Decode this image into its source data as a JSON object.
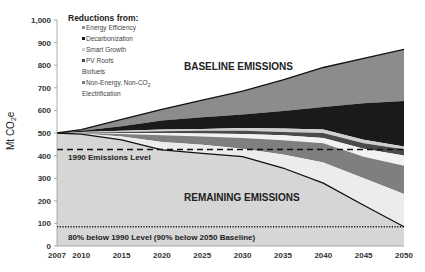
{
  "chart_data": {
    "type": "area",
    "title": "",
    "xlabel": "",
    "ylabel": "Mt CO2e",
    "ylim": [
      0,
      1000
    ],
    "xlim": [
      2007,
      2050
    ],
    "x": [
      2007,
      2010,
      2015,
      2020,
      2025,
      2030,
      2035,
      2040,
      2045,
      2050
    ],
    "x_tick_labels": [
      "2007",
      "2010",
      "2015",
      "2020",
      "2025",
      "2030",
      "2035",
      "2040",
      "2045",
      "2050"
    ],
    "y_ticks": [
      0,
      100,
      200,
      300,
      400,
      500,
      600,
      700,
      800,
      900,
      1000
    ],
    "y_tick_labels": [
      "0",
      "100",
      "200",
      "300",
      "400",
      "500",
      "600",
      "700",
      "800",
      "900",
      "1,000"
    ],
    "baseline_emissions": [
      500,
      515,
      560,
      605,
      645,
      685,
      735,
      790,
      830,
      870
    ],
    "remaining_emissions": [
      500,
      495,
      470,
      425,
      410,
      395,
      345,
      278,
      180,
      85
    ],
    "boundaries_top_down": {
      "energy_efficiency_bottom": [
        500,
        510,
        530,
        555,
        570,
        582,
        598,
        615,
        632,
        642
      ],
      "decarbonization_bottom": [
        500,
        505,
        510,
        515,
        518,
        522,
        520,
        515,
        470,
        440
      ],
      "smart_growth_bottom": [
        500,
        503,
        505,
        508,
        510,
        510,
        505,
        500,
        455,
        428
      ],
      "pv_roofs_bottom": [
        500,
        501,
        500,
        500,
        498,
        496,
        490,
        478,
        430,
        400
      ],
      "biofuels_bottom": [
        500,
        500,
        495,
        490,
        485,
        478,
        468,
        455,
        395,
        355
      ],
      "non_energy_bottom": [
        500,
        498,
        485,
        460,
        448,
        430,
        405,
        370,
        300,
        230
      ]
    },
    "series": [
      {
        "name": "Energy Efficiency",
        "color": "#8c8c8c"
      },
      {
        "name": "Decarbonization",
        "color": "#1a1a1a"
      },
      {
        "name": "Smart Growth",
        "color": "#cfcfcf"
      },
      {
        "name": "PV Roofs",
        "color": "#4a4a4a"
      },
      {
        "name": "Biofuels",
        "color": "#f2f2f2"
      },
      {
        "name": "Non-Energy, Non-CO2",
        "color": "#7f7f7f"
      },
      {
        "name": "Electrification",
        "color": "#ececec"
      },
      {
        "name": "Remaining Emissions",
        "color": "#d6d6d6"
      }
    ],
    "reference_lines": [
      {
        "name": "1990 Emissions Level",
        "value": 427,
        "style": "dashed"
      },
      {
        "name": "80% below 1990 Level (90% below 2050 Baseline)",
        "value": 85,
        "style": "dotted"
      }
    ],
    "legend": {
      "title": "Reductions from:",
      "position": "top-left",
      "entries": [
        "Energy Efficiency",
        "Decarbonization",
        "Smart Growth",
        "PV Roofs",
        "Biofuels",
        "Non-Energy, Non-CO2",
        "Electrification"
      ]
    },
    "annotations": [
      "BASELINE EMISSIONS",
      "REMAINING EMISSIONS",
      "1990 Emissions Level",
      "80% below 1990 Level (90% below 2050 Baseline)"
    ],
    "grid": false
  },
  "labels": {
    "ylabel_main": "Mt CO",
    "ylabel_sub": "2",
    "ylabel_tail": "e",
    "legend_title": "Reductions from:",
    "legend_items": [
      "Energy Efficiency",
      "Decarbonization",
      "Smart Growth",
      "PV Roofs",
      "Biofuels",
      "Non-Energy, Non-CO",
      "Electrification"
    ],
    "legend_nonenergy_sub": "2",
    "baseline_label": "BASELINE EMISSIONS",
    "remaining_label": "REMAINING EMISSIONS",
    "level1990_label": "1990 Emissions Level",
    "target_label": "80% below 1990 Level (90% below 2050 Baseline)"
  }
}
